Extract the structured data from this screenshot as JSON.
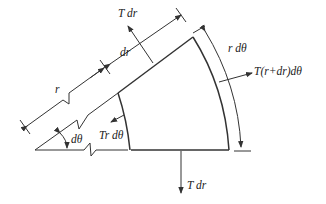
{
  "diagram": {
    "labels": {
      "top_force": "T dr",
      "bottom_force": "T dr",
      "right_force": "T(r+dr)dθ",
      "left_force": "Tr dθ",
      "radial_increment": "dr",
      "radius": "r",
      "arc_length": "r dθ",
      "angle": "dθ"
    },
    "colors": {
      "stroke": "#333333",
      "text": "#222222",
      "background": "#ffffff"
    }
  }
}
